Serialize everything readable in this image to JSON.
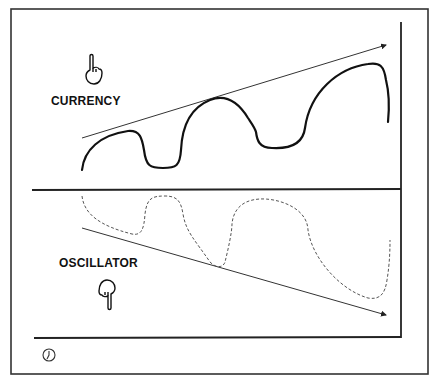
{
  "diagram": {
    "panels": [
      {
        "id": "top",
        "label": "CURRENCY",
        "line_style": "solid",
        "trend": "rising",
        "pointer": "hand-pointing-up"
      },
      {
        "id": "bottom",
        "label": "OSCILLATOR",
        "line_style": "dashed",
        "trend": "falling",
        "pointer": "hand-pointing-down"
      }
    ],
    "footer_icon": "clock-icon",
    "colors": {
      "ink": "#222222",
      "background": "#ffffff"
    }
  }
}
